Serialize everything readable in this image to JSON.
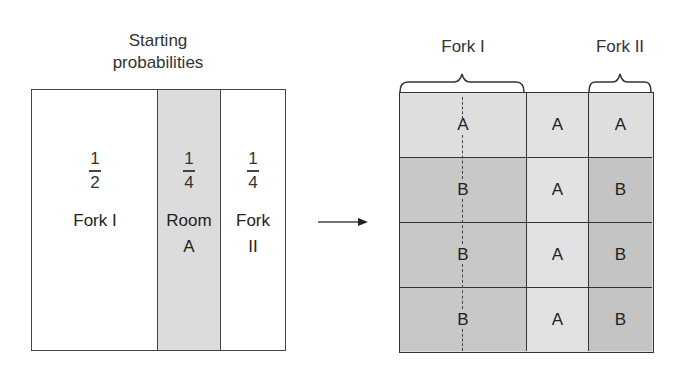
{
  "left_panel": {
    "title_line1": "Starting",
    "title_line2": "probabilities",
    "columns": [
      {
        "numerator": "1",
        "denominator": "2",
        "label_line1": "Fork I",
        "label_line2": "",
        "fill": "#ffffff"
      },
      {
        "numerator": "1",
        "denominator": "4",
        "label_line1": "Room",
        "label_line2": "A",
        "fill": "#dcdcdc"
      },
      {
        "numerator": "1",
        "denominator": "4",
        "label_line1": "Fork",
        "label_line2": "II",
        "fill": "#ffffff"
      }
    ]
  },
  "arrow": {
    "direction": "right"
  },
  "right_panel": {
    "brace_labels": {
      "fork1": "Fork I",
      "fork2": "Fork II"
    },
    "rows": [
      [
        "A",
        "A",
        "A"
      ],
      [
        "B",
        "A",
        "B"
      ],
      [
        "B",
        "A",
        "B"
      ],
      [
        "B",
        "A",
        "B"
      ]
    ],
    "colors": {
      "light": "#dedede",
      "dark": "#c4c4c4",
      "line": "#333333"
    }
  }
}
